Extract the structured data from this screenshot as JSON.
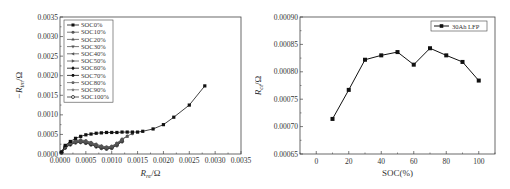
{
  "chart_data": [
    {
      "type": "line",
      "title": "",
      "xlabel": "R_re/Ω",
      "ylabel": "-R_im/Ω",
      "xlim": [
        0.0,
        0.0035
      ],
      "ylim": [
        0.0,
        0.0035
      ],
      "xticks": [
        "0.0000",
        "0.0005",
        "0.0010",
        "0.0015",
        "0.0020",
        "0.0025",
        "0.0030",
        "0.0035"
      ],
      "yticks": [
        "0.0000",
        "0.0005",
        "0.0010",
        "0.0015",
        "0.0020",
        "0.0025",
        "0.0030",
        "0.0035"
      ],
      "grid": false,
      "legend_position": "upper-left",
      "legend": [
        "SOC0%",
        "SOC10%",
        "SOC20%",
        "SOC30%",
        "SOC40%",
        "SOC50%",
        "SOC60%",
        "SOC70%",
        "SOC80%",
        "SOC90%",
        "SOC100%"
      ],
      "series": [
        {
          "name": "SOC0%",
          "marker": "square",
          "x": [
            3e-05,
            0.0001,
            0.0002,
            0.0003,
            0.0004,
            0.0005,
            0.0006,
            0.0007,
            0.0008,
            0.0009,
            0.001,
            0.0011,
            0.0012,
            0.0013,
            0.0014,
            0.0015,
            0.0016,
            0.0018,
            0.002,
            0.0022,
            0.0025,
            0.0028
          ],
          "y": [
            5e-05,
            0.00022,
            0.00032,
            0.0004,
            0.00045,
            0.00049,
            0.00051,
            0.00053,
            0.00054,
            0.00055,
            0.00055,
            0.00055,
            0.00056,
            0.00056,
            0.00056,
            0.00056,
            0.00058,
            0.00064,
            0.00075,
            0.00094,
            0.00125,
            0.00174
          ]
        },
        {
          "name": "SOC10%",
          "marker": "circle",
          "x": [
            3e-05,
            0.0001,
            0.0002,
            0.0003,
            0.0004,
            0.0005,
            0.0006,
            0.0007,
            0.0008,
            0.0009,
            0.001,
            0.0011,
            0.0012,
            0.0013,
            0.0014
          ],
          "y": [
            5e-05,
            0.0002,
            0.0003,
            0.00035,
            0.00036,
            0.00034,
            0.0003,
            0.00025,
            0.00021,
            0.00018,
            0.0002,
            0.00028,
            0.00038,
            0.00046,
            0.00052
          ]
        },
        {
          "name": "SOC20%",
          "marker": "triangle-up",
          "x": [
            3e-05,
            0.0001,
            0.0002,
            0.0003,
            0.0004,
            0.0005,
            0.0006,
            0.0007,
            0.0008,
            0.0009,
            0.001,
            0.0011,
            0.0012,
            0.0013
          ],
          "y": [
            5e-05,
            0.00019,
            0.00029,
            0.00034,
            0.00035,
            0.00033,
            0.00029,
            0.00024,
            0.0002,
            0.00017,
            0.00019,
            0.00027,
            0.00037,
            0.00045
          ]
        },
        {
          "name": "SOC30%",
          "marker": "triangle-down",
          "x": [
            3e-05,
            0.0001,
            0.0002,
            0.0003,
            0.0004,
            0.0005,
            0.0006,
            0.0007,
            0.0008,
            0.0009,
            0.001,
            0.0011,
            0.0012
          ],
          "y": [
            4e-05,
            0.00018,
            0.00027,
            0.00032,
            0.00033,
            0.00031,
            0.00027,
            0.00022,
            0.00018,
            0.00016,
            0.00018,
            0.00026,
            0.00036
          ]
        },
        {
          "name": "SOC40%",
          "marker": "triangle-left",
          "x": [
            3e-05,
            0.0001,
            0.0002,
            0.0003,
            0.0004,
            0.0005,
            0.0006,
            0.0007,
            0.0008,
            0.0009,
            0.001,
            0.0011,
            0.0012
          ],
          "y": [
            4e-05,
            0.00017,
            0.00026,
            0.00031,
            0.00032,
            0.0003,
            0.00026,
            0.00021,
            0.00017,
            0.00015,
            0.00017,
            0.00025,
            0.00035
          ]
        },
        {
          "name": "SOC50%",
          "marker": "triangle-right",
          "x": [
            3e-05,
            0.0001,
            0.0002,
            0.0003,
            0.0004,
            0.0005,
            0.0006,
            0.0007,
            0.0008,
            0.0009,
            0.001,
            0.0011,
            0.0012
          ],
          "y": [
            4e-05,
            0.00017,
            0.00026,
            0.0003,
            0.00031,
            0.0003,
            0.00026,
            0.00021,
            0.00017,
            0.00015,
            0.00017,
            0.00024,
            0.00034
          ]
        },
        {
          "name": "SOC60%",
          "marker": "diamond",
          "x": [
            3e-05,
            0.0001,
            0.0002,
            0.0003,
            0.0004,
            0.0005,
            0.0006,
            0.0007,
            0.0008,
            0.0009,
            0.001,
            0.0011,
            0.0012
          ],
          "y": [
            4e-05,
            0.00016,
            0.00025,
            0.0003,
            0.00031,
            0.00029,
            0.00025,
            0.0002,
            0.00016,
            0.00014,
            0.00016,
            0.00023,
            0.00033
          ]
        },
        {
          "name": "SOC70%",
          "marker": "hexagon",
          "x": [
            3e-05,
            0.0001,
            0.0002,
            0.0003,
            0.0004,
            0.0005,
            0.0006,
            0.0007,
            0.0008,
            0.0009,
            0.001,
            0.0011,
            0.0012
          ],
          "y": [
            4e-05,
            0.00017,
            0.00026,
            0.00031,
            0.00032,
            0.0003,
            0.00026,
            0.00021,
            0.00017,
            0.00015,
            0.00017,
            0.00025,
            0.00035
          ]
        },
        {
          "name": "SOC80%",
          "marker": "pentagon",
          "x": [
            3e-05,
            0.0001,
            0.0002,
            0.0003,
            0.0004,
            0.0005,
            0.0006,
            0.0007,
            0.0008,
            0.0009,
            0.001,
            0.0011,
            0.0012
          ],
          "y": [
            4e-05,
            0.00016,
            0.00025,
            0.0003,
            0.00031,
            0.00029,
            0.00025,
            0.0002,
            0.00016,
            0.00014,
            0.00016,
            0.00024,
            0.00034
          ]
        },
        {
          "name": "SOC90%",
          "marker": "star",
          "x": [
            3e-05,
            0.0001,
            0.0002,
            0.0003,
            0.0004,
            0.0005,
            0.0006,
            0.0007,
            0.0008,
            0.0009,
            0.001,
            0.0011,
            0.0012
          ],
          "y": [
            4e-05,
            0.00016,
            0.00025,
            0.00029,
            0.0003,
            0.00028,
            0.00024,
            0.00019,
            0.00016,
            0.00014,
            0.00016,
            0.00023,
            0.00033
          ]
        },
        {
          "name": "SOC100%",
          "marker": "circle-open",
          "x": [
            3e-05,
            0.0001,
            0.0002,
            0.0003,
            0.0004,
            0.0005,
            0.0006,
            0.0007,
            0.0008,
            0.0009,
            0.001,
            0.0011,
            0.0012
          ],
          "y": [
            4e-05,
            0.00016,
            0.00024,
            0.00029,
            0.0003,
            0.00028,
            0.00024,
            0.00019,
            0.00015,
            0.00013,
            0.00015,
            0.00022,
            0.00032
          ]
        }
      ]
    },
    {
      "type": "line",
      "title": "",
      "xlabel": "SOC(%)",
      "ylabel": "R_ct/Ω",
      "xlim": [
        -10,
        110
      ],
      "ylim": [
        0.00065,
        0.0009
      ],
      "xticks": [
        "0",
        "20",
        "40",
        "60",
        "80",
        "100"
      ],
      "yticks": [
        "0.00065",
        "0.00070",
        "0.00075",
        "0.00080",
        "0.00085",
        "0.00090"
      ],
      "grid": false,
      "legend_position": "upper-right",
      "legend": [
        "30Ah LFP"
      ],
      "series": [
        {
          "name": "30Ah LFP",
          "marker": "square",
          "x": [
            10,
            20,
            30,
            40,
            50,
            60,
            70,
            80,
            90,
            100
          ],
          "y": [
            0.000714,
            0.000767,
            0.000822,
            0.00083,
            0.000836,
            0.000813,
            0.000843,
            0.00083,
            0.000818,
            0.000784
          ]
        }
      ]
    }
  ],
  "labels": {
    "left_ylabel_prefix": "−R",
    "left_ylabel_sub": "im",
    "left_ylabel_unit": "/Ω",
    "left_xlabel_prefix": "R",
    "left_xlabel_sub": "re",
    "left_xlabel_unit": "/Ω",
    "right_ylabel_prefix": "R",
    "right_ylabel_sub": "ct",
    "right_ylabel_unit": "/Ω",
    "right_xlabel": "SOC(%)"
  }
}
